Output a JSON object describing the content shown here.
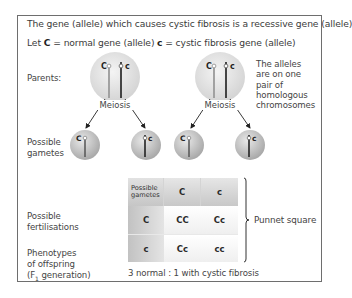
{
  "header": {
    "line1": "The gene (allele) which causes cystic fibrosis is a recessive gene (allele)",
    "line2_prefix": "Let ",
    "dominant_symbol": "C",
    "line2_dominant_def": " = normal gene (allele)",
    "recessive_symbol": "c",
    "line2_recessive_def": " = cystic fibrosis gene (allele)"
  },
  "row_labels": {
    "parents": "Parents:",
    "gametes_1": "Possible",
    "gametes_2": "gametes",
    "fert_1": "Possible",
    "fert_2": "fertilisations",
    "pheno_1": "Phenotypes",
    "pheno_2": "of offspring",
    "pheno_3_pre": "(F",
    "pheno_3_sub": "1",
    "pheno_3_post": " generation)"
  },
  "parents": [
    {
      "alleles": [
        "C",
        "c"
      ],
      "process": "Meiosis"
    },
    {
      "alleles": [
        "C",
        "c"
      ],
      "process": "Meiosis"
    }
  ],
  "note": [
    "The alleles",
    "are on one",
    "pair of",
    "homologous",
    "chromosomes"
  ],
  "gametes": [
    "C",
    "c",
    "C",
    "c"
  ],
  "punnett": {
    "corner_1": "Possible",
    "corner_2": "gametes",
    "col_headers": [
      "C",
      "c"
    ],
    "rows": [
      {
        "header": "C",
        "cells": [
          "CC",
          "Cc"
        ]
      },
      {
        "header": "c",
        "cells": [
          "Cc",
          "cc"
        ]
      }
    ],
    "bracket_label": "Punnet square"
  },
  "ratio": "3 normal : 1 with cystic fibrosis",
  "colors": {
    "frame": "#6e6e6e",
    "cell_sphere": "#d9d9d9",
    "chromosome_light": "#9a9a9a",
    "chromosome_dark": "#333333"
  }
}
